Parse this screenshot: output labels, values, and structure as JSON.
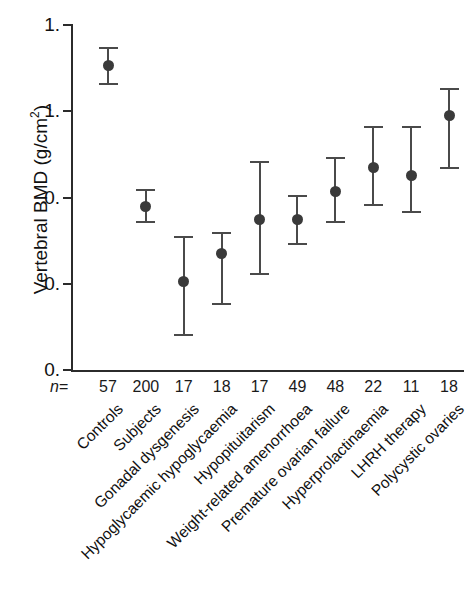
{
  "chart_data": {
    "type": "scatter",
    "title": "",
    "xlabel": "",
    "ylabel": "Vertebral BMD (g/cm",
    "ylabel_sup": "2",
    "ylabel_close": ")",
    "ylim": [
      0.0,
      1.6
    ],
    "yticks": [
      1.6,
      1.2,
      0.8,
      0.4,
      0.0
    ],
    "ytick_labels": [
      "1.",
      "1.",
      "0.",
      "0.",
      "0."
    ],
    "grid": false,
    "legend": null,
    "error_bar_type": "range",
    "n_prefix": "n",
    "n_equals": "=",
    "categories": [
      "Controls",
      "Subjects",
      "Gonadal dysgenesis",
      "Hypoglycaemic hypoglycaemia",
      "Hypopituitarism",
      "Weight-related amenorrhoea",
      "Premature ovarian failure",
      "Hyperprolactinaemia",
      "LHRH therapy",
      "Polycystic ovaries"
    ],
    "n_values": [
      "57",
      "200",
      "17",
      "18",
      "17",
      "49",
      "48",
      "22",
      "11",
      "18"
    ],
    "values": [
      1.41,
      0.76,
      0.41,
      0.54,
      0.7,
      0.7,
      0.83,
      0.94,
      0.9,
      1.18
    ],
    "err_low": [
      1.32,
      0.68,
      0.16,
      0.3,
      0.44,
      0.58,
      0.68,
      0.76,
      0.73,
      0.93
    ],
    "err_high": [
      1.5,
      0.84,
      0.62,
      0.64,
      0.97,
      0.81,
      0.99,
      1.13,
      1.13,
      1.31
    ],
    "colors": {
      "marker": "#3a3a3a",
      "error_bar": "#4a4a4a",
      "axis": "#2b2b2b",
      "text": "#111111",
      "background": "#ffffff"
    }
  }
}
